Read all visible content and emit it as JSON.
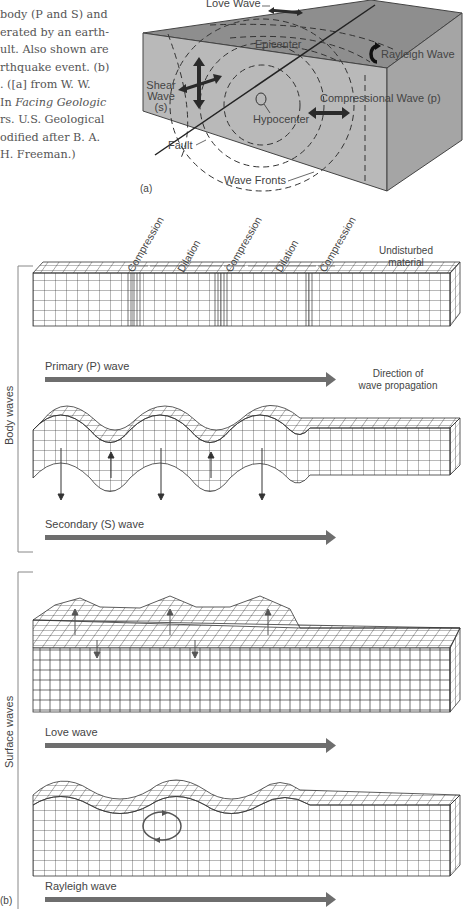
{
  "caption": {
    "lines": [
      "body (P and S) and",
      "erated by an earth-",
      "ult. Also shown are",
      "rthquake event. (b)",
      ". ([a] from W. W.",
      "In ",
      "rs. U.S. Geological",
      "odified after B. A.",
      "H. Freeman.)"
    ],
    "italic_title": "Facing Geologic"
  },
  "panel_a": {
    "label": "(a)",
    "labels": {
      "love_wave": "Love Wave",
      "epicenter": "Epicenter",
      "rayleigh_wave": "Rayleigh Wave",
      "shear_wave": [
        "Shear",
        "Wave",
        "(s)"
      ],
      "compressional_wave": "Compressional Wave (p)",
      "hypocenter": "Hypocenter",
      "fault": "Fault",
      "wave_fronts": "Wave Fronts"
    },
    "colors": {
      "block_top": "#8e8e8e",
      "block_front": "#b9b9b9",
      "block_side": "#a3a3a3",
      "arrow": "#2a2a2a"
    }
  },
  "panel_b": {
    "label": "(b)",
    "zone_labels": [
      "Compression",
      "Dilation",
      "Compression",
      "Dilation",
      "Compression"
    ],
    "undisturbed": [
      "Undisturbed",
      "material"
    ],
    "direction": [
      "Direction of",
      "wave propagation"
    ],
    "groups": [
      {
        "name": "Body waves",
        "waves": [
          "Primary (P) wave",
          "Secondary (S) wave"
        ]
      },
      {
        "name": "Surface waves",
        "waves": [
          "Love wave",
          "Rayleigh wave"
        ]
      }
    ],
    "colors": {
      "grid": "#333333",
      "arrow": "#6e6e6e",
      "bracket": "#888888"
    }
  }
}
